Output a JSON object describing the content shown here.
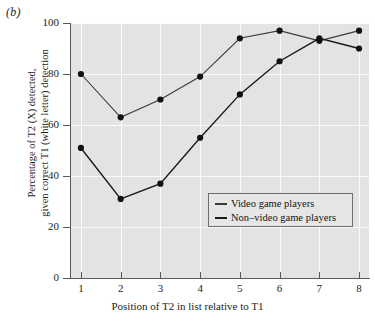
{
  "figure": {
    "panel_label": "(b)"
  },
  "chart_data": {
    "type": "line",
    "title": "",
    "panel": "(b)",
    "xlabel": "Position of T2 in list relative to T1",
    "ylabel": "Percentage of T2 (X) detected, given correct T1 (white letter) detection",
    "ylabel_lines": [
      "Percentage of T2 (X) detected,",
      "given correct T1 (white letter) detection"
    ],
    "x": [
      1,
      2,
      3,
      4,
      5,
      6,
      7,
      8
    ],
    "xticklabels": [
      "1",
      "2",
      "3",
      "4",
      "5",
      "6",
      "7",
      "8"
    ],
    "yticks": [
      0,
      20,
      40,
      60,
      80,
      100
    ],
    "yticklabels": [
      "0",
      "20",
      "40",
      "60",
      "80",
      "100"
    ],
    "xlim": [
      0.75,
      8.25
    ],
    "ylim": [
      0,
      100
    ],
    "grid": true,
    "legend_position": "lower right",
    "series": [
      {
        "name": "Video game players",
        "color": "#3b3b3b",
        "marker": "circle",
        "values": [
          80,
          63,
          70,
          79,
          94,
          97,
          93,
          97
        ]
      },
      {
        "name": "Non–video game players",
        "color": "#1a1a1a",
        "marker": "circle",
        "values": [
          51,
          31,
          37,
          55,
          72,
          85,
          94,
          90
        ]
      }
    ]
  },
  "legend": {
    "items": [
      {
        "label": "Video game players"
      },
      {
        "label": "Non–video game players"
      }
    ]
  },
  "colors": {
    "plot_background": "#e3e3e3",
    "gridline": "#fbfbfb",
    "axis": "#5a5a5a",
    "series_1": "#3b3b3b",
    "series_2": "#1a1a1a",
    "text": "#1d1d1d"
  }
}
